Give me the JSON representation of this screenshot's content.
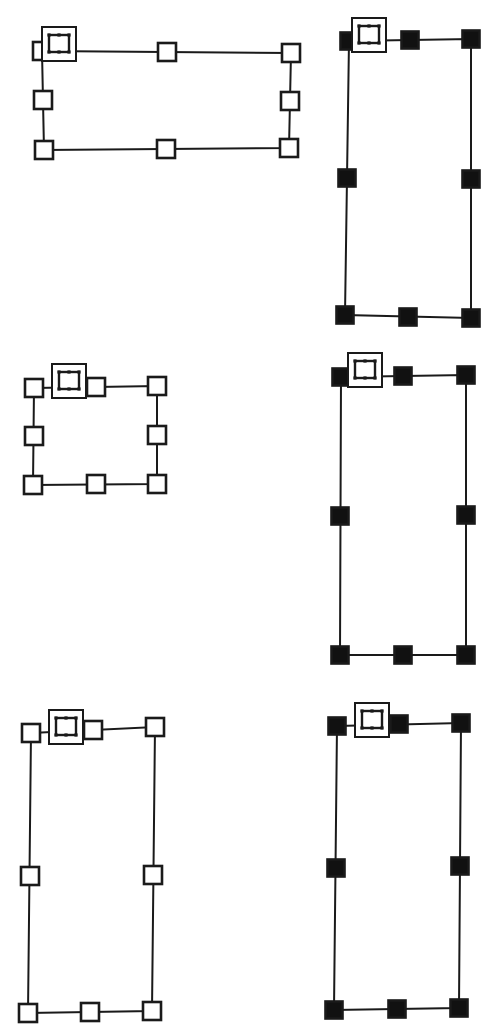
{
  "canvas": {
    "width": 490,
    "height": 1034,
    "background": "#ffffff",
    "title": "Selection handle rectangles"
  },
  "style": {
    "stroke_color": "#1a1a1a",
    "fill_hollow": "#ffffff",
    "fill_solid": "#111111",
    "outline_width": 2,
    "handle_stroke_width": 2.6,
    "handle_size_hollow": 18,
    "handle_size_solid": 17,
    "badge_outer_size": 34,
    "badge_stroke_width": 2,
    "badge_inner_stroke_width": 2.4
  },
  "legend": {
    "hollow_handle_label": "hollow-handle",
    "solid_handle_label": "solid-handle",
    "badge_label": "resize-badge"
  },
  "shapes": [
    {
      "id": "shape-top-left",
      "name": "top-left-wide-rectangle",
      "handle_style": "hollow",
      "corners": {
        "tl": {
          "x": 42,
          "y": 51
        },
        "tr": {
          "x": 291,
          "y": 53
        },
        "br": {
          "x": 289,
          "y": 148
        },
        "bl": {
          "x": 44,
          "y": 150
        }
      },
      "midpoints": {
        "top": {
          "x": 167,
          "y": 52
        },
        "right": {
          "x": 290,
          "y": 101
        },
        "bottom": {
          "x": 166,
          "y": 149
        },
        "left": {
          "x": 43,
          "y": 100
        }
      },
      "badge": {
        "x": 42,
        "y": 27
      }
    },
    {
      "id": "shape-top-right",
      "name": "top-right-tall-rectangle",
      "handle_style": "solid",
      "corners": {
        "tl": {
          "x": 349,
          "y": 41
        },
        "tr": {
          "x": 471,
          "y": 39
        },
        "br": {
          "x": 471,
          "y": 318
        },
        "bl": {
          "x": 345,
          "y": 315
        }
      },
      "midpoints": {
        "top": {
          "x": 410,
          "y": 40
        },
        "right": {
          "x": 471,
          "y": 179
        },
        "bottom": {
          "x": 408,
          "y": 317
        },
        "left": {
          "x": 347,
          "y": 178
        }
      },
      "badge": {
        "x": 352,
        "y": 18
      }
    },
    {
      "id": "shape-middle-left",
      "name": "middle-left-small-rectangle",
      "handle_style": "hollow",
      "corners": {
        "tl": {
          "x": 34,
          "y": 388
        },
        "tr": {
          "x": 157,
          "y": 386
        },
        "br": {
          "x": 157,
          "y": 484
        },
        "bl": {
          "x": 33,
          "y": 485
        }
      },
      "midpoints": {
        "top": {
          "x": 96,
          "y": 387
        },
        "right": {
          "x": 157,
          "y": 435
        },
        "bottom": {
          "x": 96,
          "y": 484
        },
        "left": {
          "x": 34,
          "y": 436
        }
      },
      "badge": {
        "x": 52,
        "y": 364
      }
    },
    {
      "id": "shape-middle-right",
      "name": "middle-right-tall-rectangle",
      "handle_style": "solid",
      "corners": {
        "tl": {
          "x": 341,
          "y": 377
        },
        "tr": {
          "x": 466,
          "y": 375
        },
        "br": {
          "x": 466,
          "y": 655
        },
        "bl": {
          "x": 340,
          "y": 655
        }
      },
      "midpoints": {
        "top": {
          "x": 403,
          "y": 376
        },
        "right": {
          "x": 466,
          "y": 515
        },
        "bottom": {
          "x": 403,
          "y": 655
        },
        "left": {
          "x": 340,
          "y": 516
        }
      },
      "badge": {
        "x": 348,
        "y": 353
      }
    },
    {
      "id": "shape-bottom-left",
      "name": "bottom-left-tall-rectangle",
      "handle_style": "hollow",
      "corners": {
        "tl": {
          "x": 31,
          "y": 733
        },
        "tr": {
          "x": 155,
          "y": 727
        },
        "br": {
          "x": 152,
          "y": 1011
        },
        "bl": {
          "x": 28,
          "y": 1013
        }
      },
      "midpoints": {
        "top": {
          "x": 93,
          "y": 730
        },
        "right": {
          "x": 153,
          "y": 875
        },
        "bottom": {
          "x": 90,
          "y": 1012
        },
        "left": {
          "x": 30,
          "y": 876
        }
      },
      "badge": {
        "x": 49,
        "y": 710
      }
    },
    {
      "id": "shape-bottom-right",
      "name": "bottom-right-tall-rectangle",
      "handle_style": "solid",
      "corners": {
        "tl": {
          "x": 337,
          "y": 726
        },
        "tr": {
          "x": 461,
          "y": 723
        },
        "br": {
          "x": 459,
          "y": 1008
        },
        "bl": {
          "x": 334,
          "y": 1010
        }
      },
      "midpoints": {
        "top": {
          "x": 399,
          "y": 724
        },
        "right": {
          "x": 460,
          "y": 866
        },
        "bottom": {
          "x": 397,
          "y": 1009
        },
        "left": {
          "x": 336,
          "y": 868
        }
      },
      "badge": {
        "x": 355,
        "y": 703
      }
    }
  ]
}
